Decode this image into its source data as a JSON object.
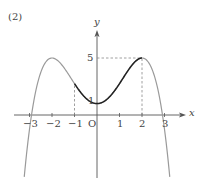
{
  "panel_label": "(2)",
  "chart_data": {
    "type": "line",
    "title": "(2)",
    "function": "y = -x^4/4 + 2x^2 + 1",
    "xlabel": "x",
    "ylabel": "y",
    "origin_label": "O",
    "x_ticks": [
      -3,
      -2,
      -1,
      1,
      2,
      3
    ],
    "x_tick_labels": [
      "−3",
      "−2",
      "−1",
      "1",
      "2",
      "3"
    ],
    "y_tick_labels": [
      "1",
      "5"
    ],
    "y_ticks": [
      1,
      5
    ],
    "xlim": [
      -3.6,
      4
    ],
    "ylim": [
      -5.5,
      8
    ],
    "grid": false,
    "series": [
      {
        "name": "full curve (gray)",
        "color": "#9a9a9a",
        "x": [
          -3.2,
          -3,
          -2.5,
          -2,
          -1.5,
          -1,
          -0.5,
          0,
          0.5,
          1,
          1.5,
          2,
          2.5,
          3,
          3.2
        ],
        "y": [
          -4.73,
          -1.25,
          3.73,
          5,
          4.23,
          2.75,
          1.48,
          1,
          1.48,
          2.75,
          4.23,
          5,
          3.73,
          -1.25,
          -4.73
        ]
      },
      {
        "name": "highlighted segment [-1, 2] (black)",
        "color": "#222222",
        "x": [
          -1,
          -0.5,
          0,
          0.5,
          1,
          1.5,
          2
        ],
        "y": [
          2.75,
          1.48,
          1,
          1.48,
          2.75,
          4.23,
          5
        ]
      }
    ],
    "annotations": [
      {
        "type": "dashed_vertical",
        "x": -1,
        "from_y": 0,
        "to_y": 2.75
      },
      {
        "type": "dashed_vertical",
        "x": 2,
        "from_y": 0,
        "to_y": 5
      },
      {
        "type": "dashed_horizontal",
        "y": 5,
        "from_x": 0,
        "to_x": 2
      },
      {
        "type": "point_label",
        "text": "5",
        "at": [
          0,
          5
        ]
      },
      {
        "type": "point_label",
        "text": "1",
        "at": [
          0,
          1
        ]
      }
    ],
    "colors": {
      "curve": "#9a9a9a",
      "highlight": "#222222",
      "axes": "#555555",
      "dashes": "#888888"
    }
  }
}
